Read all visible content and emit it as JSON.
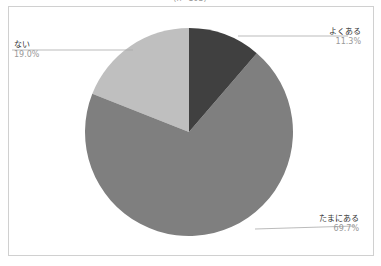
{
  "chart_data": {
    "type": "pie",
    "title": "(n=103)",
    "categories": [
      "よくある",
      "たまにある",
      "ない"
    ],
    "values": [
      11.3,
      69.7,
      19.0
    ],
    "labels": [
      "11.3%",
      "69.7%",
      "19.0%"
    ],
    "colors": [
      "#404040",
      "#7f7f7f",
      "#bfbfbf"
    ],
    "start_angle_deg": 0,
    "direction": "clockwise",
    "legend": "none (callout labels)"
  }
}
